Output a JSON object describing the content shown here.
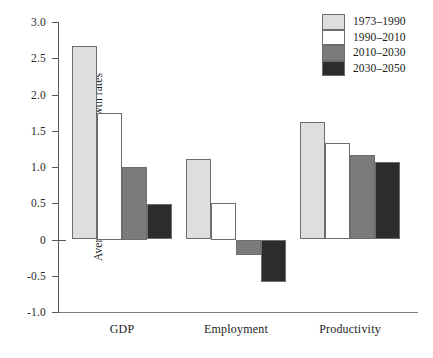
{
  "chart_data": {
    "type": "bar",
    "title": "",
    "subtitle": "",
    "xlabel": "",
    "ylabel": "Average annual percentage growth rates",
    "ylim": [
      -1.0,
      3.0
    ],
    "yticks": [
      3.0,
      2.5,
      2.0,
      1.5,
      1.0,
      0.5,
      0,
      -0.5,
      -1.0
    ],
    "ytick_labels": [
      "3.0",
      "2.5",
      "2.0",
      "1.5",
      "1.0",
      "0.5",
      "0",
      "-0.5",
      "-1.0"
    ],
    "grid": false,
    "legend_position": "top-right",
    "categories": [
      "GDP",
      "Employment",
      "Productivity"
    ],
    "series": [
      {
        "name": "1973–1990",
        "color": "#dedede",
        "values": [
          2.67,
          1.11,
          1.62
        ]
      },
      {
        "name": "1990–2010",
        "color": "#ffffff",
        "values": [
          1.75,
          0.5,
          1.33
        ]
      },
      {
        "name": "2010–2030",
        "color": "#7b7b7b",
        "values": [
          1.0,
          -0.21,
          1.16
        ]
      },
      {
        "name": "2030–2050",
        "color": "#2c2c2c",
        "values": [
          0.49,
          -0.59,
          1.07
        ]
      }
    ]
  },
  "legend": {
    "items": [
      {
        "label": "1973–1990",
        "color": "#dedede"
      },
      {
        "label": "1990–2010",
        "color": "#ffffff"
      },
      {
        "label": "2010–2030",
        "color": "#7b7b7b"
      },
      {
        "label": "2030–2050",
        "color": "#2c2c2c"
      }
    ]
  },
  "colors": {
    "axis": "#58585a",
    "bar_edge": "#6d6d70",
    "text": "#1c1c1c",
    "background": "#ffffff"
  }
}
